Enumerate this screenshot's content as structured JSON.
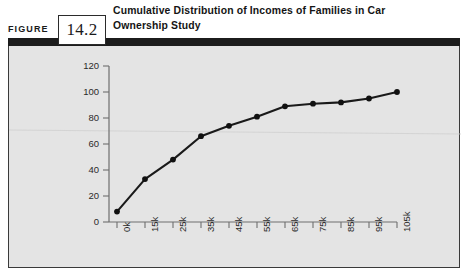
{
  "figure": {
    "label": "FIGURE",
    "number": "14.2",
    "title": "Cumulative Distribution of Incomes of Families in Car Ownership Study"
  },
  "chart_data": {
    "type": "line",
    "title": "Cumulative Distribution of Incomes of Families in Car Ownership Study",
    "xlabel": "",
    "ylabel": "",
    "categories": [
      "0k",
      "15k",
      "25k",
      "35k",
      "45k",
      "55k",
      "65k",
      "75k",
      "85k",
      "95k",
      "105k"
    ],
    "values": [
      8,
      33,
      48,
      66,
      74,
      81,
      89,
      91,
      92,
      95,
      100
    ],
    "series": [
      {
        "name": "Cumulative percent",
        "values": [
          8,
          33,
          48,
          66,
          74,
          81,
          89,
          91,
          92,
          95,
          100
        ]
      }
    ],
    "y_ticks": [
      0,
      20,
      40,
      60,
      80,
      100,
      120
    ],
    "ylim": [
      0,
      120
    ],
    "grid": false,
    "legend": "none",
    "marker": "filled-circle",
    "line_color": "#1a1a1a",
    "marker_color": "#111111",
    "axis_color": "#6e6e6e",
    "plot_background": "#e4e4e4"
  },
  "colors": {
    "panel_background": "#e4e4e4",
    "panel_border": "#3a3a3a",
    "header_rule": "#1c1c1c",
    "text": "#141414"
  }
}
